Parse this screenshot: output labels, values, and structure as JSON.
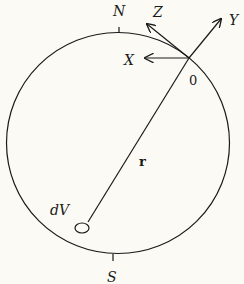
{
  "diagram": {
    "type": "geometric-figure",
    "labels": {
      "north": "N",
      "south": "S",
      "x_axis": "X",
      "y_axis": "Y",
      "z_axis": "Z",
      "origin": "0",
      "vector": "r",
      "volume_element": "dV"
    },
    "colors": {
      "background": "#fbfaf4",
      "ink": "#1a1a1a"
    }
  }
}
